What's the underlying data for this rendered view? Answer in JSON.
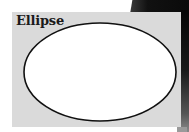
{
  "card": {
    "label": "Ellipse",
    "background_color": "#dadada"
  },
  "shape": {
    "type": "ellipse",
    "fill_color": "#ffffff",
    "stroke_color": "#111111"
  }
}
